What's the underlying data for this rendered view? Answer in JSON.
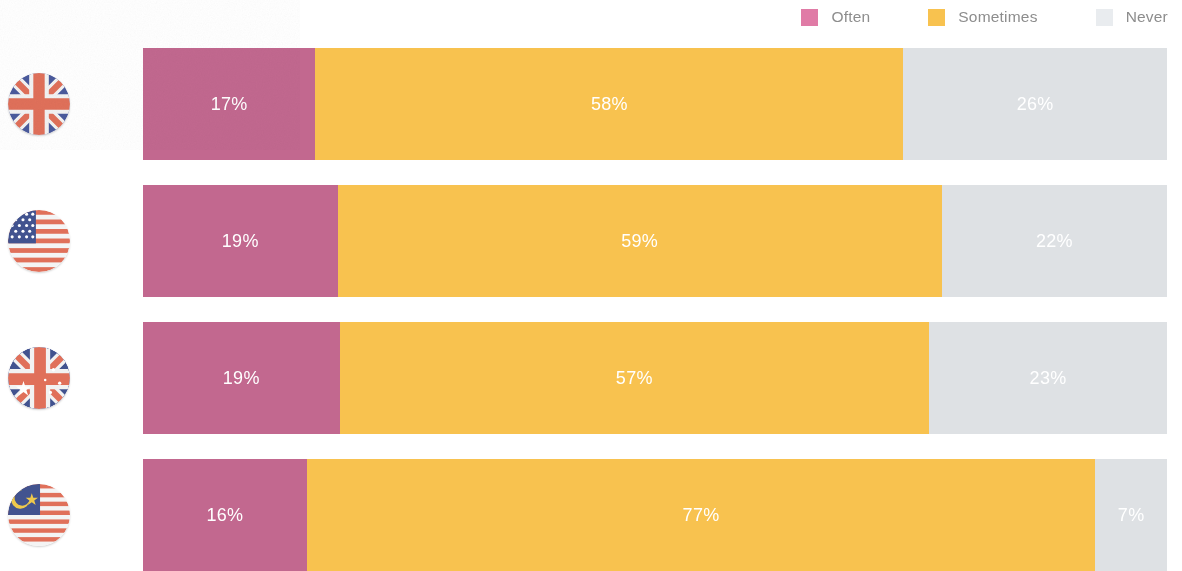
{
  "legend": {
    "items": [
      {
        "label": "Often",
        "color": "#c2688f",
        "swatch_color": "#e07ba6"
      },
      {
        "label": "Sometimes",
        "color": "#f8c24f",
        "swatch_color": "#f8c24f"
      },
      {
        "label": "Never",
        "color": "#dee1e4",
        "swatch_color": "#e9ecef"
      }
    ]
  },
  "chart_data": {
    "type": "bar",
    "orientation": "horizontal",
    "stacked": true,
    "normalized_percent": true,
    "title": "",
    "subtitle": "",
    "xlabel": "",
    "ylabel": "",
    "xlim": [
      0,
      100
    ],
    "grid": false,
    "legend_position": "top-right",
    "value_suffix": "%",
    "categories": [
      "United Kingdom",
      "United States",
      "Australia",
      "Malaysia"
    ],
    "category_icons": [
      "flag-uk",
      "flag-usa",
      "flag-australia",
      "flag-malaysia"
    ],
    "series": [
      {
        "name": "Often",
        "color": "#c2688f",
        "values": [
          17,
          19,
          19,
          16
        ]
      },
      {
        "name": "Sometimes",
        "color": "#f8c24f",
        "values": [
          58,
          59,
          57,
          77
        ]
      },
      {
        "name": "Never",
        "color": "#dee1e4",
        "values": [
          26,
          22,
          23,
          7
        ]
      }
    ],
    "data_labels": [
      [
        "17%",
        "58%",
        "26%"
      ],
      [
        "19%",
        "59%",
        "22%"
      ],
      [
        "19%",
        "57%",
        "23%"
      ],
      [
        "16%",
        "77%",
        "7%"
      ]
    ]
  }
}
